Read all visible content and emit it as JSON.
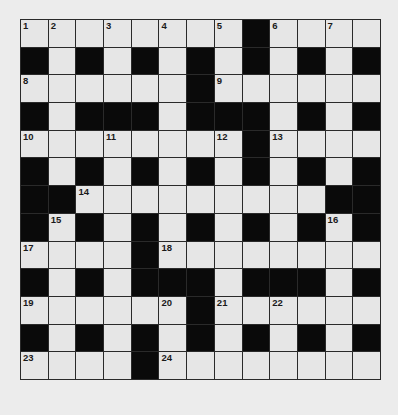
{
  "puzzle": {
    "rows": 13,
    "cols": 13,
    "colors": {
      "background": "#ececec",
      "white_cell": "#e6e6e6",
      "black_cell": "#0a0a0a",
      "grid_line": "#2a2a2a"
    },
    "layout": [
      "WWWWWWWWBWWWW",
      "BWBWBWBWBWBWB",
      "WWWWWWBWWWWWW",
      "BWBBBWBBBWBWB",
      "WWWWWWWWBWWWW",
      "BWBWBWBWBWBWB",
      "BBWWWWWWWWWBB",
      "BWBWBWBWBWBWB",
      "WWWWBWWWWWWWW",
      "BWBWBBBWBBBWB",
      "WWWWWWBWWWWWW",
      "BWBWBWBWBWBWB",
      "WWWWBWWWWWWWW"
    ],
    "numbers": [
      {
        "r": 0,
        "c": 0,
        "n": "1"
      },
      {
        "r": 0,
        "c": 1,
        "n": "2"
      },
      {
        "r": 0,
        "c": 3,
        "n": "3"
      },
      {
        "r": 0,
        "c": 5,
        "n": "4"
      },
      {
        "r": 0,
        "c": 7,
        "n": "5"
      },
      {
        "r": 0,
        "c": 9,
        "n": "6"
      },
      {
        "r": 0,
        "c": 11,
        "n": "7"
      },
      {
        "r": 2,
        "c": 0,
        "n": "8"
      },
      {
        "r": 2,
        "c": 7,
        "n": "9"
      },
      {
        "r": 4,
        "c": 0,
        "n": "10"
      },
      {
        "r": 4,
        "c": 3,
        "n": "11"
      },
      {
        "r": 4,
        "c": 7,
        "n": "12"
      },
      {
        "r": 4,
        "c": 9,
        "n": "13"
      },
      {
        "r": 6,
        "c": 2,
        "n": "14"
      },
      {
        "r": 7,
        "c": 1,
        "n": "15"
      },
      {
        "r": 7,
        "c": 11,
        "n": "16"
      },
      {
        "r": 8,
        "c": 0,
        "n": "17"
      },
      {
        "r": 8,
        "c": 5,
        "n": "18"
      },
      {
        "r": 10,
        "c": 0,
        "n": "19"
      },
      {
        "r": 10,
        "c": 5,
        "n": "20"
      },
      {
        "r": 10,
        "c": 7,
        "n": "21"
      },
      {
        "r": 10,
        "c": 9,
        "n": "22"
      },
      {
        "r": 12,
        "c": 0,
        "n": "23"
      },
      {
        "r": 12,
        "c": 5,
        "n": "24"
      }
    ]
  }
}
